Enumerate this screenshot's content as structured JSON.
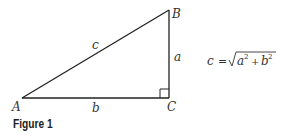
{
  "figure": {
    "caption": "Figure 1",
    "vertices": {
      "A": "A",
      "B": "B",
      "C": "C"
    },
    "sides": {
      "a": "a",
      "b": "b",
      "c": "c"
    },
    "formula": {
      "lhs": "c",
      "eq": "=",
      "radicand_a": "a",
      "exp_a": "2",
      "plus": "+",
      "radicand_b": "b",
      "exp_b": "2",
      "text": "c = √(a² + b²)"
    },
    "colors": {
      "stroke": "#222222",
      "text": "#333333"
    }
  }
}
